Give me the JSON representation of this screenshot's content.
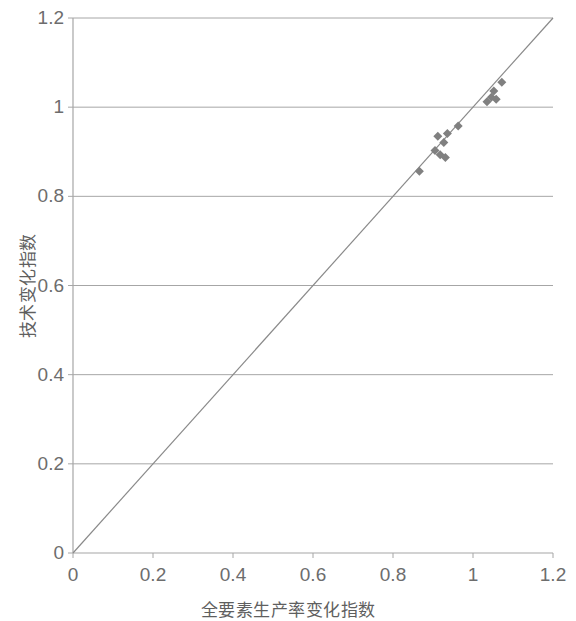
{
  "chart_data": {
    "type": "scatter",
    "title": "",
    "subtitle": "",
    "xlabel": "全要素生产率变化指数",
    "ylabel": "技术变化指数",
    "xlim": [
      0,
      1.2
    ],
    "ylim": [
      0,
      1.2
    ],
    "xticks": [
      "0",
      "0.2",
      "0.4",
      "0.6",
      "0.8",
      "1",
      "1.2"
    ],
    "yticks": [
      "0",
      "0.2",
      "0.4",
      "0.6",
      "0.8",
      "1",
      "1.2"
    ],
    "xtick_values": [
      0,
      0.2,
      0.4,
      0.6,
      0.8,
      1,
      1.2
    ],
    "ytick_values": [
      0,
      0.2,
      0.4,
      0.6,
      0.8,
      1,
      1.2
    ],
    "grid": {
      "horizontal": true,
      "vertical": false,
      "color": "#a6a6a6"
    },
    "legend": {
      "visible": false,
      "position": "none"
    },
    "marker": {
      "shape": "diamond",
      "color": "#808080",
      "size": 9
    },
    "reference_line": {
      "name": "identity-line",
      "from": [
        0,
        0
      ],
      "to": [
        1.2,
        1.2
      ],
      "color": "#8a8a8a",
      "width": 1.2
    },
    "series": [
      {
        "name": "年份观测点",
        "points": [
          [
            0.866,
            0.856
          ],
          [
            0.905,
            0.903
          ],
          [
            0.912,
            0.935
          ],
          [
            0.918,
            0.893
          ],
          [
            0.927,
            0.921
          ],
          [
            0.931,
            0.887
          ],
          [
            0.936,
            0.941
          ],
          [
            0.963,
            0.958
          ],
          [
            1.035,
            1.012
          ],
          [
            1.046,
            1.022
          ],
          [
            1.052,
            1.036
          ],
          [
            1.058,
            1.018
          ],
          [
            1.072,
            1.056
          ]
        ]
      }
    ]
  },
  "axes_geometry": {
    "left": 73,
    "right": 553,
    "top": 18,
    "bottom": 553,
    "frame_color": "#a6a6a6"
  }
}
